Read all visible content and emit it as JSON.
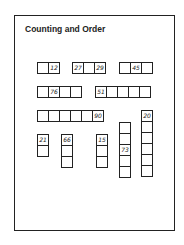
{
  "worksheet": {
    "title": "Counting and Order",
    "groups": [
      {
        "id": "row1-a",
        "orientation": "horizontal",
        "cells": [
          "",
          "12"
        ]
      },
      {
        "id": "row1-b",
        "orientation": "horizontal",
        "cells": [
          "27",
          "",
          "29"
        ]
      },
      {
        "id": "row1-c",
        "orientation": "horizontal",
        "cells": [
          "",
          "45",
          ""
        ]
      },
      {
        "id": "row2-a",
        "orientation": "horizontal",
        "cells": [
          "",
          "76",
          "",
          ""
        ]
      },
      {
        "id": "row2-b",
        "orientation": "horizontal",
        "cells": [
          "51",
          "",
          "",
          "",
          ""
        ]
      },
      {
        "id": "row3-a",
        "orientation": "horizontal",
        "cells": [
          "",
          "",
          "",
          "",
          "",
          "90"
        ]
      },
      {
        "id": "col-21",
        "orientation": "vertical",
        "cells": [
          "21",
          ""
        ]
      },
      {
        "id": "col-66",
        "orientation": "vertical",
        "cells": [
          "66",
          "",
          ""
        ]
      },
      {
        "id": "col-15",
        "orientation": "vertical",
        "cells": [
          "15",
          "",
          ""
        ]
      },
      {
        "id": "col-73",
        "orientation": "vertical",
        "cells": [
          "",
          "",
          "73",
          "",
          ""
        ]
      },
      {
        "id": "col-20",
        "orientation": "vertical",
        "cells": [
          "20",
          "",
          "",
          "",
          "",
          ""
        ]
      }
    ]
  }
}
